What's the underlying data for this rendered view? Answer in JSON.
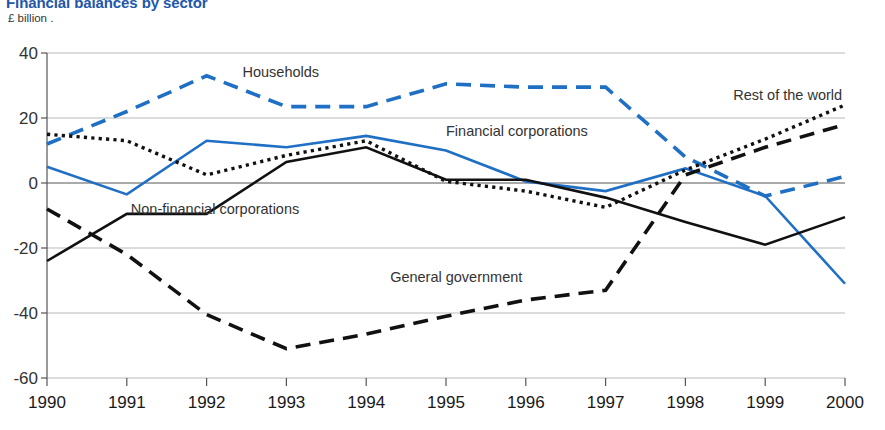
{
  "header": {
    "title": "Financial balances by sector",
    "unit_label": "£ billion .",
    "title_color": "#2256a8"
  },
  "chart_data": {
    "type": "line",
    "title": "Financial balances by sector",
    "xlabel": "",
    "ylabel": "£ billion",
    "x": [
      1990,
      1991,
      1992,
      1993,
      1994,
      1995,
      1996,
      1997,
      1998,
      1999,
      2000
    ],
    "categories": [
      "1990",
      "1991",
      "1992",
      "1993",
      "1994",
      "1995",
      "1996",
      "1997",
      "1998",
      "1999",
      "2000"
    ],
    "ylim": [
      -60,
      40
    ],
    "yticks": [
      40,
      20,
      0,
      -20,
      -40,
      -60
    ],
    "ytick_labels": [
      "40",
      "20",
      "0",
      "-20",
      "-40",
      "-60"
    ],
    "grid": true,
    "legend": "inline-annotations",
    "series": [
      {
        "name": "Households",
        "color": "#1f6fc4",
        "style": "dashed",
        "label_x": 1992.45,
        "label_y": 32.5,
        "values": [
          12,
          22,
          33,
          23.5,
          23.5,
          30.5,
          29.5,
          29.5,
          8,
          -4,
          2
        ]
      },
      {
        "name": "Financial corporations",
        "color": "#1f6fc4",
        "style": "solid",
        "label_x": 1995.0,
        "label_y": 14.5,
        "values": [
          5,
          -3.5,
          13,
          11,
          14.5,
          10,
          0.5,
          -2.5,
          4.5,
          -4,
          -31
        ]
      },
      {
        "name": "Non-financial corporations",
        "color": "#111111",
        "style": "solid",
        "label_x": 1991.05,
        "label_y": -9.5,
        "values": [
          -24,
          -9.5,
          -9.5,
          6.5,
          11,
          1,
          1,
          -4.5,
          -12,
          -19,
          -10.5
        ]
      },
      {
        "name": "General government",
        "color": "#111111",
        "style": "dashed",
        "label_x": 1994.3,
        "label_y": -30.5,
        "values": [
          -8,
          -22,
          -40.5,
          -51,
          -46.5,
          -41,
          -36,
          -33,
          2.5,
          11,
          18
        ]
      },
      {
        "name": "Rest of the world",
        "color": "#111111",
        "style": "dotted",
        "label_x": 1998.6,
        "label_y": 25.5,
        "values": [
          15,
          13,
          2.5,
          8.5,
          13,
          0.5,
          -2.5,
          -7.5,
          4,
          13.5,
          24
        ]
      }
    ]
  }
}
